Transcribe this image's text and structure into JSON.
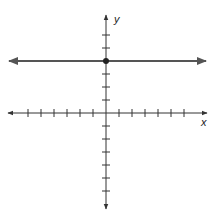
{
  "chart_data": {
    "type": "line",
    "title": "",
    "xlabel": "x",
    "ylabel": "y",
    "xlim": [
      -7,
      7
    ],
    "ylim": [
      -7,
      7
    ],
    "grid": false,
    "ticks": {
      "x_count_each_side": 6,
      "y_count_each_side": 6,
      "tick_labels": false
    },
    "series": [
      {
        "name": "horizontal line y = 4",
        "equation": "y = 4",
        "x": [
          -7.5,
          7.5
        ],
        "y": [
          4,
          4
        ],
        "color": "#555555"
      }
    ],
    "points": [
      {
        "label": "y-intercept",
        "x": 0,
        "y": 4
      }
    ]
  },
  "axes": {
    "x_label": "x",
    "y_label": "y",
    "color": "#333333"
  },
  "colors": {
    "line": "#555555",
    "axis": "#333333",
    "point": "#222222"
  }
}
